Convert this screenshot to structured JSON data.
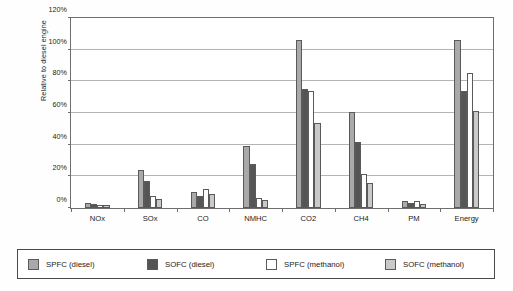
{
  "chart_data": {
    "type": "bar",
    "title": "",
    "xlabel": "",
    "ylabel": "Relative to diesel engine",
    "ylim": [
      0,
      120
    ],
    "ytick_step": 20,
    "ytick_labels": [
      "0%",
      "20%",
      "40%",
      "60%",
      "80%",
      "100%",
      "120%"
    ],
    "ytick_values": [
      0,
      20,
      40,
      60,
      80,
      100,
      120
    ],
    "grid": true,
    "legend_position": "bottom",
    "categories": [
      "NOx",
      "SOx",
      "CO",
      "NMHC",
      "CO2",
      "CH4",
      "PM",
      "Energy"
    ],
    "series": [
      {
        "name": "SPFC (diesel)",
        "color": "#a9a9a9",
        "values": [
          3.2,
          24.0,
          10.0,
          39.0,
          106.0,
          60.5,
          4.5,
          106.0
        ]
      },
      {
        "name": "SOFC (diesel)",
        "color": "#555555",
        "values": [
          2.5,
          17.3,
          7.8,
          28.0,
          75.0,
          42.0,
          3.0,
          74.0
        ]
      },
      {
        "name": "SPFC (methanol)",
        "color": "#ffffff",
        "values": [
          1.8,
          7.8,
          11.8,
          6.2,
          74.0,
          21.3,
          4.5,
          85.0
        ]
      },
      {
        "name": "SOFC (methanol)",
        "color": "#c9c9c9",
        "values": [
          1.8,
          5.6,
          8.8,
          4.8,
          53.5,
          16.0,
          2.8,
          61.0
        ]
      }
    ]
  },
  "legend": {
    "items": [
      {
        "label": "SPFC (diesel)",
        "color": "#a9a9a9"
      },
      {
        "label": "SOFC (diesel)",
        "color": "#555555"
      },
      {
        "label": "SPFC (methanol)",
        "color": "#ffffff"
      },
      {
        "label": "SOFC (methanol)",
        "color": "#c9c9c9"
      }
    ]
  }
}
